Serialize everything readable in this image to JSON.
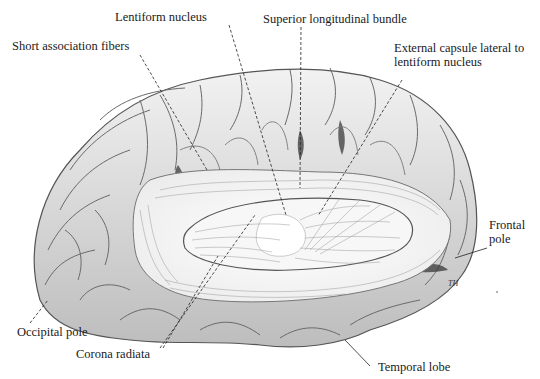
{
  "figure": {
    "signature": "TH"
  },
  "labels": [
    {
      "id": "lentiform-nucleus",
      "text": "Lentiform nucleus"
    },
    {
      "id": "superior-longitudinal-bundle",
      "text": "Superior longitudinal bundle"
    },
    {
      "id": "short-association-fibers",
      "text": "Short association fibers"
    },
    {
      "id": "external-capsule",
      "text": "External capsule lateral to\nlentiform nucleus"
    },
    {
      "id": "frontal-pole",
      "text": "Frontal\npole"
    },
    {
      "id": "occipital-pole",
      "text": "Occipital pole"
    },
    {
      "id": "corona-radiata",
      "text": "Corona radiata"
    },
    {
      "id": "temporal-lobe",
      "text": "Temporal lobe"
    }
  ]
}
